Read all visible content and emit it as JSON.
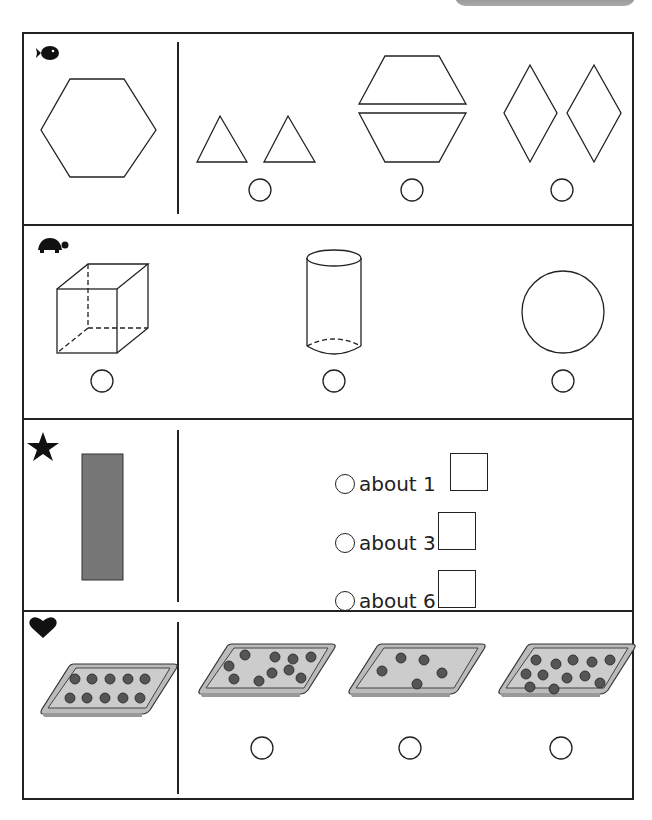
{
  "worksheet": {
    "header_tab": "",
    "questions": [
      {
        "marker": "fish-icon",
        "prompt_shape": "hexagon",
        "answer_choices": [
          {
            "label": "two triangles",
            "selected": false
          },
          {
            "label": "two trapezoids",
            "selected": false
          },
          {
            "label": "two rhombuses",
            "selected": false
          }
        ]
      },
      {
        "marker": "turtle-icon",
        "answer_choices": [
          {
            "label": "cube",
            "selected": false
          },
          {
            "label": "cylinder",
            "selected": false
          },
          {
            "label": "circle",
            "selected": false
          }
        ]
      },
      {
        "marker": "star-icon",
        "prompt_shape": "gray rectangle",
        "answer_choices": [
          {
            "label": "about 1",
            "selected": false
          },
          {
            "label": "about 3",
            "selected": false
          },
          {
            "label": "about 6",
            "selected": false
          }
        ]
      },
      {
        "marker": "heart-icon",
        "prompt_tray_dots": 10,
        "answer_choices": [
          {
            "label": "tray with 10 dots",
            "dots": 10,
            "selected": false
          },
          {
            "label": "tray with 5 dots",
            "dots": 5,
            "selected": false
          },
          {
            "label": "tray with 12 dots",
            "dots": 12,
            "selected": false
          }
        ]
      }
    ],
    "footer_text": ""
  }
}
